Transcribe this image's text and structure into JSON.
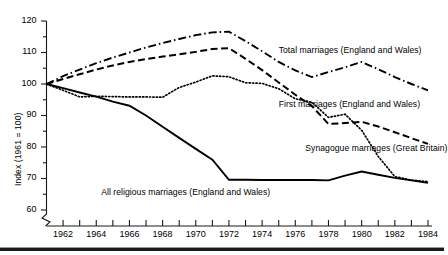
{
  "chart_data": {
    "type": "line",
    "title": "",
    "subtitle": "",
    "xlabel": "",
    "ylabel": "Index (1961 = 100)",
    "xlim": [
      1961,
      1984
    ],
    "ylim": [
      58,
      120
    ],
    "ytick_values": [
      60,
      70,
      80,
      90,
      100,
      110,
      120
    ],
    "ytick_labels": [
      "60",
      "70",
      "80",
      "90",
      "100",
      "110",
      "120"
    ],
    "y_minor_tick_step": 5,
    "y_axis_break": true,
    "x": [
      1961,
      1962,
      1963,
      1964,
      1965,
      1966,
      1967,
      1968,
      1969,
      1970,
      1971,
      1972,
      1973,
      1974,
      1975,
      1976,
      1977,
      1978,
      1979,
      1980,
      1981,
      1982,
      1983,
      1984
    ],
    "xtick_values": [
      1961,
      1962,
      1963,
      1964,
      1965,
      1966,
      1967,
      1968,
      1969,
      1970,
      1971,
      1972,
      1973,
      1974,
      1975,
      1976,
      1977,
      1978,
      1979,
      1980,
      1981,
      1982,
      1983,
      1984
    ],
    "xtick_labels": [
      "1962",
      "1964",
      "1966",
      "1968",
      "1970",
      "1972",
      "1974",
      "1976",
      "1978",
      "1980",
      "1982",
      "1984"
    ],
    "xtick_labelled_values": [
      1962,
      1964,
      1966,
      1968,
      1970,
      1972,
      1974,
      1976,
      1978,
      1980,
      1982,
      1984
    ],
    "grid": false,
    "legend_position": "inline-annotations",
    "series": [
      {
        "name": "Total marriages (England and Wales)",
        "style": "dash-dot",
        "values": [
          100.0,
          102.5,
          104.6,
          106.6,
          108.4,
          110.0,
          111.6,
          113.0,
          114.3,
          115.5,
          116.4,
          116.6,
          113.6,
          110.4,
          107.0,
          104.3,
          102.2,
          103.8,
          105.3,
          107.0,
          104.7,
          102.2,
          100.0,
          98.0
        ]
      },
      {
        "name": "First marriages (England and Wales)",
        "style": "dashed",
        "values": [
          100.0,
          101.6,
          103.1,
          104.6,
          105.9,
          107.0,
          107.9,
          108.7,
          109.4,
          110.2,
          111.1,
          111.4,
          108.0,
          104.4,
          100.5,
          96.6,
          93.0,
          87.3,
          87.6,
          88.0,
          86.5,
          84.7,
          82.8,
          81.0
        ]
      },
      {
        "name": "Synagogue marriages (Great Britain)",
        "style": "dotted",
        "values": [
          100.0,
          98.0,
          95.9,
          96.1,
          96.0,
          95.9,
          95.9,
          95.8,
          98.9,
          100.6,
          102.6,
          102.3,
          100.4,
          100.2,
          98.5,
          95.3,
          94.2,
          89.4,
          90.4,
          85.3,
          77.0,
          70.6,
          69.5,
          69.0
        ]
      },
      {
        "name": "All religious marriages (England and Wales)",
        "style": "solid",
        "values": [
          100.0,
          98.7,
          97.3,
          96.0,
          94.4,
          93.1,
          90.0,
          86.4,
          82.9,
          79.4,
          76.0,
          69.6,
          69.6,
          69.5,
          69.5,
          69.5,
          69.5,
          69.4,
          70.9,
          72.2,
          71.2,
          70.2,
          69.4,
          68.6
        ]
      }
    ],
    "annotations": [
      {
        "text": "Total marriages (England and Wales)",
        "x": 1975.0,
        "y": 110.5
      },
      {
        "text": "First marriages (England and Wales)",
        "x": 1975.0,
        "y": 93.5
      },
      {
        "text": "Synagogue marriages (Great Britain)",
        "x": 1976.6,
        "y": 79.5
      },
      {
        "text": "All religious marriages (England and Wales)",
        "x": 1964.3,
        "y": 65.5
      }
    ]
  },
  "style": {
    "line_color": "#000000",
    "axis_color": "#1a1a1a",
    "background": "#ffffff"
  }
}
